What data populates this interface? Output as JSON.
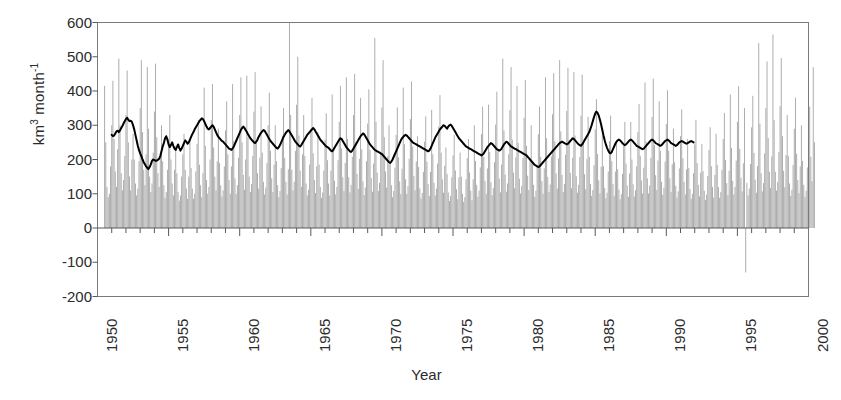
{
  "figure": {
    "width": 841,
    "height": 400,
    "background": "#ffffff"
  },
  "axis_titles": {
    "y_prefix": "km",
    "y_sup1": "3",
    "y_mid": " month",
    "y_sup2": "-1",
    "y_full": "km3 month-1",
    "x": "Year"
  },
  "colors": {
    "bars": "#a9a9a9",
    "trend_line": "#000000",
    "axis": "#595959",
    "text": "#2b2b2b",
    "frame": "#7a7a7a",
    "background": "#ffffff"
  },
  "chart_data": {
    "type": "bar",
    "title": "",
    "subtitle": "",
    "xlabel": "Year",
    "ylabel": "km3 month-1",
    "ylim": [
      -200,
      600
    ],
    "xlim": [
      1950,
      2000
    ],
    "ytick_labels": [
      "600",
      "500",
      "400",
      "300",
      "200",
      "100",
      "0",
      "-100",
      "-200"
    ],
    "ytick_values": [
      600,
      500,
      400,
      300,
      200,
      100,
      0,
      -100,
      -200
    ],
    "xtick_labels": [
      "1950",
      "1955",
      "1960",
      "1965",
      "1970",
      "1975",
      "1980",
      "1985",
      "1990",
      "1995",
      "2000"
    ],
    "xtick_values": [
      1950,
      1955,
      1960,
      1965,
      1970,
      1975,
      1980,
      1985,
      1990,
      1995,
      2000
    ],
    "minor_xtick_interval": 1,
    "grid": false,
    "legend": null,
    "legend_position": "none",
    "annotations": [],
    "series": [
      {
        "name": "Monthly discharge",
        "type": "bar",
        "color": "#a9a9a9",
        "x_start": 1950.5,
        "x_step": 0.0833333,
        "note": "monthly values, 600 points from 1950-07 to 2000-06",
        "values": [
          415,
          250,
          120,
          90,
          100,
          180,
          300,
          430,
          260,
          165,
          120,
          230,
          495,
          300,
          160,
          110,
          140,
          210,
          330,
          460,
          250,
          150,
          110,
          200,
          275,
          200,
          130,
          95,
          115,
          195,
          350,
          490,
          280,
          170,
          125,
          215,
          470,
          290,
          150,
          105,
          130,
          220,
          340,
          480,
          265,
          160,
          120,
          205,
          300,
          195,
          125,
          88,
          105,
          170,
          260,
          330,
          200,
          130,
          95,
          170,
          240,
          160,
          105,
          80,
          95,
          150,
          215,
          275,
          170,
          115,
          85,
          150,
          260,
          175,
          115,
          85,
          100,
          165,
          245,
          315,
          185,
          125,
          90,
          160,
          410,
          240,
          140,
          100,
          120,
          200,
          315,
          420,
          235,
          150,
          110,
          195,
          290,
          190,
          125,
          92,
          110,
          180,
          285,
          370,
          215,
          140,
          100,
          180,
          420,
          255,
          145,
          100,
          125,
          205,
          330,
          440,
          250,
          155,
          112,
          200,
          445,
          265,
          150,
          105,
          128,
          210,
          340,
          455,
          255,
          160,
          115,
          205,
          355,
          220,
          135,
          98,
          118,
          190,
          300,
          395,
          225,
          145,
          105,
          185,
          300,
          195,
          125,
          90,
          108,
          175,
          270,
          350,
          205,
          135,
          98,
          172,
          600,
          330,
          170,
          110,
          135,
          225,
          360,
          500,
          270,
          168,
          120,
          215,
          330,
          210,
          130,
          95,
          112,
          185,
          290,
          380,
          218,
          140,
          102,
          180,
          280,
          185,
          120,
          88,
          104,
          168,
          258,
          335,
          198,
          130,
          95,
          168,
          390,
          235,
          138,
          98,
          120,
          198,
          310,
          415,
          232,
          148,
          108,
          190,
          440,
          260,
          148,
          104,
          126,
          208,
          330,
          450,
          252,
          158,
          114,
          202,
          380,
          230,
          136,
          96,
          118,
          195,
          305,
          405,
          228,
          146,
          106,
          188,
          555,
          310,
          162,
          108,
          132,
          220,
          352,
          490,
          265,
          165,
          118,
          210,
          300,
          195,
          125,
          90,
          108,
          176,
          272,
          352,
          206,
          136,
          99,
          173,
          410,
          245,
          142,
          100,
          122,
          202,
          318,
          428,
          238,
          152,
          110,
          194,
          268,
          178,
          116,
          86,
          102,
          164,
          252,
          326,
          194,
          128,
          93,
          164,
          345,
          215,
          132,
          95,
          115,
          188,
          296,
          388,
          220,
          142,
          103,
          182,
          235,
          158,
          104,
          79,
          94,
          148,
          212,
          272,
          168,
          113,
          84,
          148,
          220,
          150,
          100,
          76,
          90,
          142,
          204,
          260,
          162,
          109,
          81,
          142,
          300,
          196,
          126,
          91,
          109,
          177,
          274,
          354,
          208,
          137,
          100,
          174,
          360,
          222,
          134,
          96,
          117,
          192,
          302,
          398,
          224,
          144,
          104,
          185,
          495,
          285,
          156,
          106,
          130,
          215,
          344,
          470,
          258,
          162,
          116,
          206,
          415,
          248,
          144,
          101,
          123,
          204,
          322,
          432,
          240,
          153,
          111,
          196,
          300,
          196,
          126,
          91,
          109,
          177,
          274,
          354,
          208,
          137,
          100,
          174,
          440,
          262,
          149,
          105,
          127,
          209,
          332,
          452,
          253,
          159,
          115,
          203,
          490,
          282,
          155,
          105,
          129,
          214,
          342,
          468,
          257,
          161,
          116,
          205,
          455,
          270,
          151,
          103,
          126,
          207,
          328,
          448,
          250,
          157,
          113,
          201,
          325,
          208,
          129,
          94,
          111,
          183,
          288,
          376,
          216,
          139,
          101,
          179,
          270,
          180,
          117,
          87,
          103,
          165,
          254,
          328,
          195,
          129,
          94,
          165,
          255,
          172,
          112,
          84,
          99,
          158,
          240,
          310,
          188,
          124,
          91,
          159,
          310,
          200,
          128,
          92,
          110,
          180,
          280,
          362,
          211,
          139,
          101,
          176,
          425,
          252,
          145,
          101,
          124,
          205,
          324,
          436,
          242,
          154,
          111,
          197,
          370,
          226,
          135,
          97,
          118,
          194,
          304,
          402,
          226,
          145,
          105,
          186,
          290,
          192,
          123,
          89,
          107,
          174,
          268,
          346,
          204,
          135,
          98,
          171,
          260,
          175,
          114,
          85,
          100,
          160,
          244,
          316,
          190,
          126,
          92,
          161,
          245,
          166,
          109,
          82,
          97,
          152,
          228,
          294,
          180,
          120,
          89,
          155,
          275,
          184,
          119,
          88,
          105,
          170,
          260,
          336,
          199,
          131,
          96,
          167,
          390,
          234,
          138,
          98,
          120,
          197,
          310,
          414,
          231,
          147,
          107,
          189,
          350,
          -130,
          132,
          95,
          115,
          187,
          294,
          386,
          219,
          141,
          103,
          181,
          540,
          305,
          160,
          107,
          131,
          218,
          350,
          486,
          263,
          164,
          117,
          209,
          565,
          315,
          164,
          109,
          134,
          222,
          356,
          496,
          268,
          167,
          119,
          213,
          330,
          210,
          130,
          94,
          112,
          184,
          290,
          380,
          217,
          140,
          102,
          180,
          300,
          196,
          126,
          91,
          109,
          177,
          274,
          354,
          208,
          137,
          470,
          250
        ]
      },
      {
        "name": "12-month running mean",
        "type": "line",
        "color": "#000000",
        "x_start": 1951.0,
        "x_step": 0.0833333,
        "note": "smoothed annual trend line",
        "values": [
          272,
          268,
          270,
          276,
          282,
          284,
          280,
          285,
          292,
          298,
          305,
          312,
          318,
          322,
          316,
          312,
          313,
          310,
          300,
          288,
          272,
          256,
          240,
          228,
          218,
          210,
          200,
          192,
          186,
          180,
          176,
          172,
          178,
          186,
          196,
          200,
          198,
          196,
          197,
          199,
          202,
          210,
          224,
          238,
          248,
          262,
          268,
          258,
          244,
          236,
          242,
          250,
          240,
          232,
          228,
          236,
          244,
          234,
          226,
          232,
          240,
          248,
          256,
          252,
          246,
          250,
          258,
          266,
          274,
          280,
          288,
          294,
          300,
          306,
          312,
          316,
          320,
          318,
          312,
          304,
          296,
          290,
          288,
          292,
          296,
          300,
          296,
          288,
          280,
          272,
          266,
          262,
          258,
          254,
          252,
          248,
          244,
          240,
          236,
          232,
          230,
          228,
          232,
          238,
          246,
          254,
          262,
          270,
          278,
          286,
          292,
          296,
          292,
          286,
          280,
          274,
          268,
          262,
          258,
          254,
          250,
          248,
          252,
          258,
          266,
          272,
          278,
          282,
          286,
          284,
          278,
          272,
          266,
          260,
          254,
          250,
          246,
          242,
          238,
          234,
          232,
          236,
          242,
          250,
          258,
          266,
          272,
          278,
          282,
          286,
          282,
          276,
          270,
          264,
          258,
          252,
          248,
          244,
          240,
          238,
          242,
          248,
          254,
          260,
          266,
          272,
          276,
          280,
          284,
          288,
          292,
          288,
          282,
          276,
          270,
          264,
          258,
          254,
          250,
          246,
          242,
          238,
          236,
          234,
          230,
          226,
          224,
          228,
          234,
          240,
          246,
          252,
          258,
          262,
          260,
          254,
          248,
          242,
          236,
          232,
          228,
          224,
          222,
          226,
          232,
          238,
          244,
          250,
          256,
          262,
          268,
          272,
          276,
          274,
          268,
          262,
          256,
          250,
          244,
          240,
          236,
          232,
          228,
          226,
          224,
          222,
          220,
          218,
          216,
          212,
          208,
          204,
          200,
          196,
          192,
          190,
          194,
          200,
          208,
          216,
          224,
          232,
          240,
          248,
          256,
          262,
          266,
          270,
          272,
          270,
          266,
          262,
          258,
          254,
          250,
          248,
          246,
          244,
          242,
          240,
          238,
          236,
          234,
          232,
          230,
          228,
          226,
          224,
          226,
          232,
          240,
          248,
          256,
          264,
          270,
          276,
          282,
          288,
          292,
          296,
          300,
          298,
          294,
          290,
          296,
          300,
          302,
          298,
          292,
          286,
          280,
          274,
          268,
          262,
          258,
          254,
          250,
          246,
          242,
          238,
          236,
          234,
          232,
          230,
          228,
          226,
          224,
          222,
          220,
          218,
          216,
          214,
          212,
          214,
          218,
          224,
          230,
          236,
          240,
          244,
          248,
          246,
          242,
          238,
          234,
          230,
          228,
          226,
          228,
          232,
          238,
          244,
          248,
          252,
          250,
          246,
          242,
          238,
          236,
          234,
          232,
          230,
          228,
          226,
          224,
          222,
          220,
          218,
          216,
          214,
          212,
          208,
          204,
          200,
          196,
          192,
          188,
          184,
          182,
          180,
          178,
          180,
          184,
          188,
          192,
          196,
          200,
          204,
          208,
          212,
          216,
          220,
          224,
          228,
          232,
          236,
          240,
          244,
          248,
          250,
          252,
          250,
          248,
          246,
          244,
          246,
          250,
          254,
          258,
          262,
          260,
          256,
          252,
          248,
          244,
          242,
          240,
          244,
          250,
          256,
          262,
          268,
          274,
          280,
          290,
          300,
          312,
          324,
          334,
          340,
          336,
          328,
          316,
          302,
          286,
          270,
          256,
          244,
          234,
          226,
          220,
          218,
          222,
          230,
          238,
          246,
          252,
          256,
          258,
          256,
          252,
          248,
          244,
          242,
          244,
          248,
          252,
          256,
          258,
          256,
          252,
          248,
          244,
          240,
          238,
          236,
          234,
          232,
          230,
          232,
          236,
          240,
          244,
          248,
          252,
          256,
          258,
          256,
          252,
          248,
          246,
          244,
          242,
          240,
          242,
          246,
          250,
          254,
          256,
          258,
          256,
          252,
          248,
          246,
          244,
          242,
          240,
          242,
          246,
          250,
          252,
          254,
          252,
          250,
          248,
          246,
          248,
          250,
          252,
          254,
          252,
          250
        ]
      }
    ]
  }
}
